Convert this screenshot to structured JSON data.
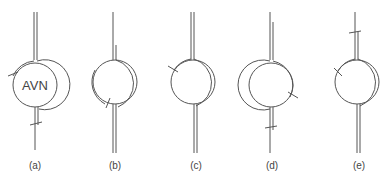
{
  "figure": {
    "panels": [
      {
        "id": "a",
        "label": "(a)",
        "center_label": "AVN"
      },
      {
        "id": "b",
        "label": "(b)",
        "center_label": ""
      },
      {
        "id": "c",
        "label": "(c)",
        "center_label": ""
      },
      {
        "id": "d",
        "label": "(d)",
        "center_label": ""
      },
      {
        "id": "e",
        "label": "(e)",
        "center_label": ""
      }
    ]
  }
}
